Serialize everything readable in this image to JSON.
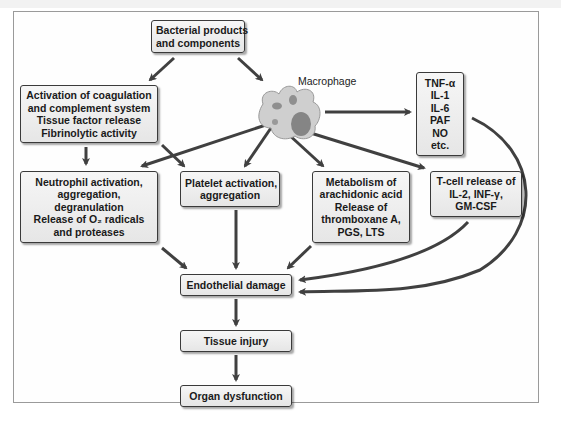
{
  "diagram": {
    "nodes": {
      "bacterial": {
        "lines": [
          "Bacterial products",
          "and components"
        ]
      },
      "coagulation": {
        "lines": [
          "Activation of coagulation",
          "and complement system",
          "Tissue factor release",
          "Fibrinolytic activity"
        ]
      },
      "macrophage_label": "Macrophage",
      "cytokines": {
        "lines": [
          "TNF-α",
          "IL-1",
          "IL-6",
          "PAF",
          "NO",
          "etc."
        ]
      },
      "neutrophil": {
        "lines": [
          "Neutrophil activation,",
          "aggregation,",
          "degranulation",
          "Release of O₂ radicals",
          "and proteases"
        ]
      },
      "platelet": {
        "lines": [
          "Platelet activation,",
          "aggregation"
        ]
      },
      "arachidonic": {
        "lines": [
          "Metabolism of",
          "arachidonic acid",
          "Release of",
          "thromboxane A,",
          "PGS, LTS"
        ]
      },
      "tcell": {
        "lines": [
          "T-cell release of",
          "IL-2, INF-γ,",
          "GM-CSF"
        ]
      },
      "endothelial": {
        "lines": [
          "Endothelial damage"
        ]
      },
      "tissue": {
        "lines": [
          "Tissue injury"
        ]
      },
      "organ": {
        "lines": [
          "Organ dysfunction"
        ]
      }
    },
    "edges": [
      {
        "from": "Bacterial products and components",
        "to": "Activation of coagulation and complement system"
      },
      {
        "from": "Bacterial products and components",
        "to": "Macrophage"
      },
      {
        "from": "Macrophage",
        "to": "TNF-α, IL-1, IL-6, PAF, NO, etc."
      },
      {
        "from": "Macrophage",
        "to": "Neutrophil activation"
      },
      {
        "from": "Macrophage",
        "to": "Platelet activation"
      },
      {
        "from": "Macrophage",
        "to": "Metabolism of arachidonic acid"
      },
      {
        "from": "Macrophage",
        "to": "T-cell release"
      },
      {
        "from": "Activation of coagulation",
        "to": "Neutrophil activation"
      },
      {
        "from": "Activation of coagulation",
        "to": "Platelet activation"
      },
      {
        "from": "Neutrophil activation",
        "to": "Endothelial damage"
      },
      {
        "from": "Platelet activation",
        "to": "Endothelial damage"
      },
      {
        "from": "Metabolism of arachidonic acid",
        "to": "Endothelial damage"
      },
      {
        "from": "T-cell release",
        "to": "Endothelial damage"
      },
      {
        "from": "TNF-α, IL-1, IL-6, PAF, NO, etc.",
        "to": "Endothelial damage"
      },
      {
        "from": "Endothelial damage",
        "to": "Tissue injury"
      },
      {
        "from": "Tissue injury",
        "to": "Organ dysfunction"
      }
    ],
    "colors": {
      "box_fill": "#eeeeee",
      "box_border": "#3a3a3a",
      "arrow": "#404040",
      "macrophage": "#c8c8c8"
    }
  }
}
